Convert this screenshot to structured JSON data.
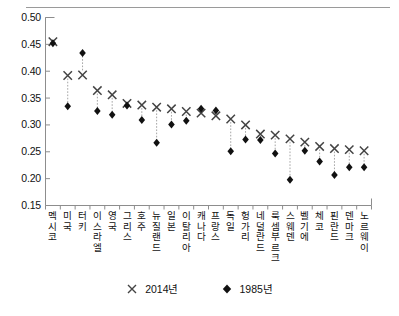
{
  "chart_data": {
    "type": "scatter",
    "title": "",
    "subtitle": "",
    "xlabel": "",
    "ylabel": "",
    "ylim": [
      0.15,
      0.5
    ],
    "yticks": [
      "0.15",
      "0.20",
      "0.25",
      "0.30",
      "0.35",
      "0.40",
      "0.45",
      "0.50"
    ],
    "ytick_values": [
      0.15,
      0.2,
      0.25,
      0.3,
      0.35,
      0.4,
      0.45,
      0.5
    ],
    "grid": false,
    "legend_position": "bottom",
    "categories": [
      "멕시코",
      "미국",
      "터키",
      "이스라엘",
      "영국",
      "그리스",
      "호주",
      "뉴질랜드",
      "일본",
      "이탈리아",
      "캐나다",
      "프랑스",
      "독일",
      "헝가리",
      "네덜란드",
      "룩셈부르크",
      "스웨덴",
      "벨기에",
      "체코",
      "핀란드",
      "덴마크",
      "노르웨이"
    ],
    "series": [
      {
        "name": "2014년",
        "marker": "x-cross",
        "color": "#444444",
        "values": [
          0.455,
          0.392,
          0.393,
          0.364,
          0.356,
          0.34,
          0.337,
          0.333,
          0.33,
          0.325,
          0.322,
          0.317,
          0.311,
          0.3,
          0.283,
          0.281,
          0.274,
          0.268,
          0.26,
          0.256,
          0.254,
          0.252
        ]
      },
      {
        "name": "1985년",
        "marker": "diamond",
        "color": "#111111",
        "values": [
          0.452,
          0.335,
          0.434,
          0.326,
          0.319,
          0.336,
          0.309,
          0.267,
          0.301,
          0.308,
          0.33,
          0.327,
          0.251,
          0.273,
          0.272,
          0.247,
          0.198,
          0.252,
          0.232,
          0.207,
          0.221,
          0.221
        ]
      }
    ]
  },
  "legend": {
    "items": [
      {
        "glyph": "x-cross-marker",
        "label": "2014년"
      },
      {
        "glyph": "diamond-marker",
        "label": "1985년"
      }
    ]
  }
}
